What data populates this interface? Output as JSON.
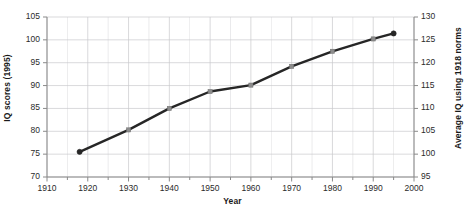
{
  "chart_data": {
    "type": "line",
    "title": "",
    "xlabel": "Year",
    "ylabel": "IQ scores (1995)",
    "ylabel_right": "Average IQ using 1918 norms",
    "x": [
      1918,
      1930,
      1940,
      1950,
      1960,
      1970,
      1980,
      1990,
      1995
    ],
    "values": [
      75.5,
      80.3,
      85.0,
      88.7,
      90.1,
      94.2,
      97.5,
      100.2,
      101.4
    ],
    "series": [
      {
        "name": "IQ scores (1995 norms)",
        "values": [
          75.5,
          80.3,
          85.0,
          88.7,
          90.1,
          94.2,
          97.5,
          100.2,
          101.4
        ]
      }
    ],
    "values_right_axis": [
      100.5,
      105.3,
      110.0,
      113.7,
      115.1,
      119.2,
      122.5,
      125.2,
      126.4
    ],
    "xlim": [
      1910,
      2000
    ],
    "ylim": [
      70,
      105
    ],
    "ylim_right": [
      95,
      130
    ],
    "xticks": [
      1910,
      1920,
      1930,
      1940,
      1950,
      1960,
      1970,
      1980,
      1990,
      2000
    ],
    "yticks_left": [
      70,
      75,
      80,
      85,
      90,
      95,
      100,
      105
    ],
    "yticks_right": [
      95,
      100,
      105,
      110,
      115,
      120,
      125,
      130
    ],
    "xtick_labels": [
      "1910",
      "1920",
      "1930",
      "1940",
      "1950",
      "1960",
      "1970",
      "1980",
      "1990",
      "2000"
    ],
    "ytick_left_labels": [
      "70",
      "75",
      "80",
      "85",
      "90",
      "95",
      "100",
      "105"
    ],
    "ytick_right_labels": [
      "95",
      "100",
      "105",
      "110",
      "115",
      "120",
      "125",
      "130"
    ],
    "grid": true,
    "legend": "none",
    "line_color": "#262626",
    "marker_color": "#8c8c8c",
    "grid_color": "#c8c8cc",
    "axis_color": "#8a8a8a"
  }
}
